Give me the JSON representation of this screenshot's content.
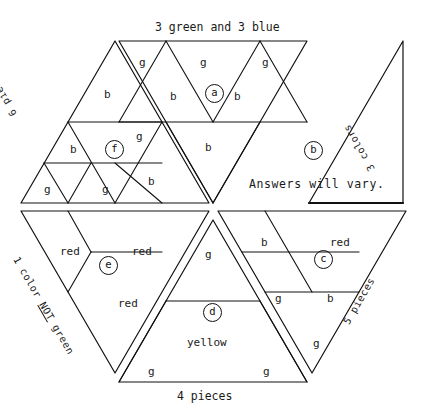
{
  "page": {
    "background_color": "#ffffff",
    "line_color": "#111111",
    "width": 422,
    "height": 419
  },
  "captions": {
    "top": "3 green and 3 blue",
    "bottom": "4 pieces",
    "upper_left_edge": "6 pieces",
    "right_edge": "3 colors",
    "lower_left_edge_line1": "1 color",
    "lower_left_edge_not": "NOT",
    "lower_left_edge_line2": "green",
    "lower_right_edge": "5 pieces"
  },
  "notes": {
    "answers_will_vary": "Answers will vary."
  },
  "circled_labels": [
    {
      "id": "a",
      "text": "a",
      "x": 205,
      "y": 84
    },
    {
      "id": "b",
      "text": "b",
      "x": 304,
      "y": 141
    },
    {
      "id": "c",
      "text": "c",
      "x": 314,
      "y": 250
    },
    {
      "id": "d",
      "text": "d",
      "x": 203,
      "y": 303
    },
    {
      "id": "e",
      "text": "e",
      "x": 99,
      "y": 256
    },
    {
      "id": "f",
      "text": "f",
      "x": 105,
      "y": 140
    }
  ],
  "piece_labels": [
    {
      "text": "g",
      "x": 139,
      "y": 56,
      "region": "top-middle"
    },
    {
      "text": "g",
      "x": 200,
      "y": 56,
      "region": "top-middle"
    },
    {
      "text": "g",
      "x": 262,
      "y": 56,
      "region": "top-middle"
    },
    {
      "text": "b",
      "x": 104,
      "y": 88,
      "region": "upper-left"
    },
    {
      "text": "b",
      "x": 170,
      "y": 90,
      "region": "top-middle"
    },
    {
      "text": "b",
      "x": 234,
      "y": 90,
      "region": "top-middle"
    },
    {
      "text": "g",
      "x": 136,
      "y": 130,
      "region": "upper-left"
    },
    {
      "text": "b",
      "x": 70,
      "y": 143,
      "region": "upper-left"
    },
    {
      "text": "b",
      "x": 205,
      "y": 141,
      "region": "top-middle"
    },
    {
      "text": "g",
      "x": 44,
      "y": 183,
      "region": "upper-left"
    },
    {
      "text": "g",
      "x": 102,
      "y": 183,
      "region": "upper-left"
    },
    {
      "text": "b",
      "x": 148,
      "y": 175,
      "region": "upper-left"
    },
    {
      "text": "red",
      "x": 60,
      "y": 245,
      "region": "lower-left"
    },
    {
      "text": "red",
      "x": 132,
      "y": 245,
      "region": "lower-left"
    },
    {
      "text": "red",
      "x": 118,
      "y": 297,
      "region": "lower-left"
    },
    {
      "text": "g",
      "x": 205,
      "y": 248,
      "region": "bottom-middle"
    },
    {
      "text": "yellow",
      "x": 187,
      "y": 336,
      "region": "bottom-middle"
    },
    {
      "text": "g",
      "x": 148,
      "y": 365,
      "region": "bottom-middle"
    },
    {
      "text": "g",
      "x": 263,
      "y": 365,
      "region": "bottom-middle"
    },
    {
      "text": "b",
      "x": 261,
      "y": 236,
      "region": "lower-right"
    },
    {
      "text": "red",
      "x": 330,
      "y": 236,
      "region": "lower-right"
    },
    {
      "text": "g",
      "x": 275,
      "y": 292,
      "region": "lower-right"
    },
    {
      "text": "b",
      "x": 327,
      "y": 292,
      "region": "lower-right"
    },
    {
      "text": "g",
      "x": 313,
      "y": 337,
      "region": "lower-right"
    }
  ]
}
